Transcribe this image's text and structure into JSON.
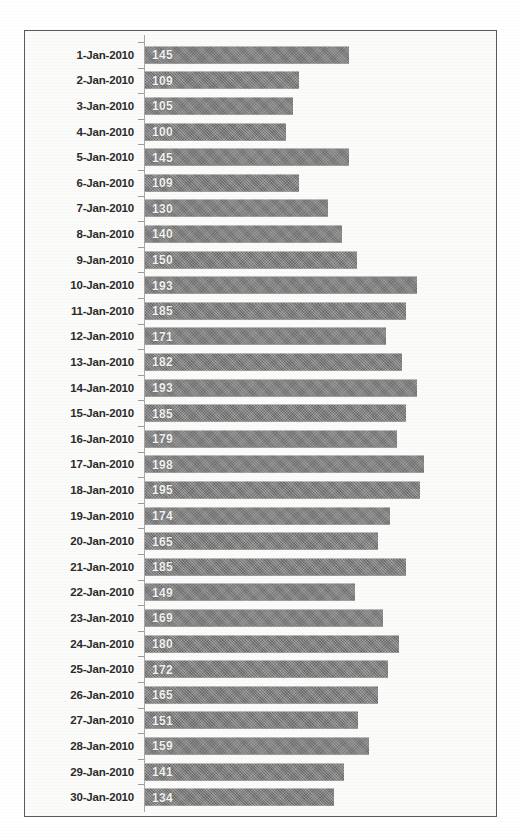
{
  "chart_data": {
    "type": "bar",
    "orientation": "horizontal",
    "title": "",
    "subtitle": "",
    "xlabel": "",
    "ylabel": "",
    "grid": false,
    "legend": false,
    "data_labels": true,
    "axis_origin": 0,
    "xlim": [
      0,
      210
    ],
    "bar_color": "#7e7e7e",
    "label_color": "#f2f2f2",
    "categories": [
      "1-Jan-2010",
      "2-Jan-2010",
      "3-Jan-2010",
      "4-Jan-2010",
      "5-Jan-2010",
      "6-Jan-2010",
      "7-Jan-2010",
      "8-Jan-2010",
      "9-Jan-2010",
      "10-Jan-2010",
      "11-Jan-2010",
      "12-Jan-2010",
      "13-Jan-2010",
      "14-Jan-2010",
      "15-Jan-2010",
      "16-Jan-2010",
      "17-Jan-2010",
      "18-Jan-2010",
      "19-Jan-2010",
      "20-Jan-2010",
      "21-Jan-2010",
      "22-Jan-2010",
      "23-Jan-2010",
      "24-Jan-2010",
      "25-Jan-2010",
      "26-Jan-2010",
      "27-Jan-2010",
      "28-Jan-2010",
      "29-Jan-2010",
      "30-Jan-2010"
    ],
    "values": [
      145,
      109,
      105,
      100,
      145,
      109,
      130,
      140,
      150,
      193,
      185,
      171,
      182,
      193,
      185,
      179,
      198,
      195,
      174,
      165,
      185,
      149,
      169,
      180,
      172,
      165,
      151,
      159,
      141,
      134
    ]
  }
}
